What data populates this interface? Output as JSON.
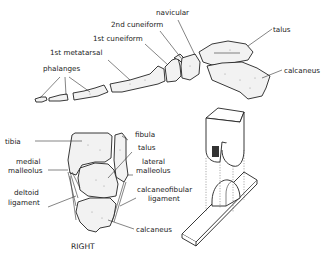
{
  "diagram": {
    "type": "anatomical-illustration",
    "foot_labels": {
      "navicular": "navicular",
      "cuneiform2": "2nd cuneiform",
      "cuneiform1": "1st cuneiform",
      "metatarsal1": "1st metatarsal",
      "phalanges": "phalanges",
      "talus": "talus",
      "calcaneus": "calcaneus"
    },
    "ankle_labels": {
      "fibula": "fibula",
      "tibia": "tibia",
      "talus": "talus",
      "medial_malleolus_1": "medial",
      "medial_malleolus_2": "malleolus",
      "lateral_malleolus_1": "lateral",
      "lateral_malleolus_2": "malleolus",
      "deltoid_1": "deltoid",
      "deltoid_2": "ligament",
      "calcaneofibular_1": "calcaneofibular",
      "calcaneofibular_2": "ligament",
      "calcaneus": "calcaneus"
    },
    "caption": "RIGHT"
  }
}
